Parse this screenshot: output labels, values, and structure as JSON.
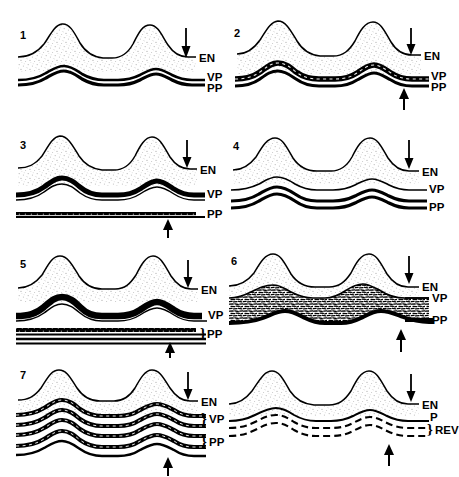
{
  "figure": {
    "type": "scientific-line-diagram",
    "background_color": "#ffffff",
    "ink_color": "#000000",
    "stipple_color": "#cfcfcf",
    "panel_count": 8,
    "columns": 2,
    "rows": 4
  },
  "panels": [
    {
      "id": "panel-1",
      "number": "1",
      "labels": {
        "en": "EN",
        "vp": "VP",
        "pp": "PP"
      },
      "down_arrow": true,
      "up_arrow": false,
      "vp_brace": false,
      "pp_brace": false,
      "style": "thin-double-lamina"
    },
    {
      "id": "panel-2",
      "number": "2",
      "labels": {
        "en": "EN",
        "vp": "VP",
        "pp": "PP"
      },
      "down_arrow": true,
      "up_arrow": true,
      "vp_brace": false,
      "pp_brace": false,
      "style": "thickened-dark-band"
    },
    {
      "id": "panel-3",
      "number": "3",
      "labels": {
        "en": "EN",
        "vp": "VP",
        "pp": "PP"
      },
      "down_arrow": true,
      "up_arrow": true,
      "vp_brace": false,
      "pp_brace": false,
      "style": "separated-flat-pp"
    },
    {
      "id": "panel-4",
      "number": "4",
      "labels": {
        "en": "EN",
        "vp": "VP",
        "pp": "PP"
      },
      "down_arrow": true,
      "up_arrow": false,
      "vp_brace": false,
      "pp_brace": false,
      "style": "thin-vp-thick-pp"
    },
    {
      "id": "panel-5",
      "number": "5",
      "labels": {
        "en": "EN",
        "vp": "VP",
        "pp": "PP"
      },
      "down_arrow": true,
      "up_arrow": true,
      "vp_brace": false,
      "pp_brace": true,
      "style": "wavy-vp-flat-stacked-pp"
    },
    {
      "id": "panel-6",
      "number": "6",
      "labels": {
        "en": "EN",
        "vp": "VP",
        "pp": "PP"
      },
      "down_arrow": true,
      "up_arrow": true,
      "vp_brace": false,
      "pp_brace": false,
      "style": "scribble-filled-zone"
    },
    {
      "id": "panel-7",
      "number": "7",
      "labels": {
        "en": "EN",
        "vp": "VP",
        "pp": "PP"
      },
      "down_arrow": true,
      "up_arrow": true,
      "vp_brace": true,
      "pp_brace": true,
      "style": "multilayer-reduplicated"
    },
    {
      "id": "panel-8",
      "number": "",
      "labels": {
        "en": "EN",
        "p": "P",
        "rev": "REV"
      },
      "down_arrow": true,
      "up_arrow": true,
      "vp_brace": false,
      "pp_brace": true,
      "style": "dashed-reversal"
    }
  ],
  "legend_terms": {
    "en": "EN",
    "vp": "VP",
    "pp": "PP",
    "p": "P",
    "rev": "REV"
  }
}
